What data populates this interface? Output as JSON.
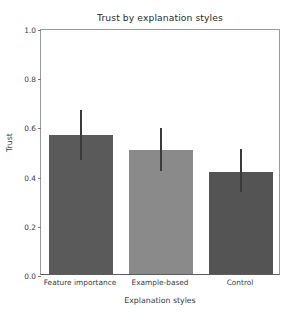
{
  "chart_data": {
    "type": "bar",
    "title": "Trust by explanation styles",
    "xlabel": "Explanation styles",
    "ylabel": "Trust",
    "categories": [
      "Feature importance",
      "Example-based",
      "Control"
    ],
    "values": [
      0.565,
      0.504,
      0.415
    ],
    "errors": [
      0.1,
      0.087,
      0.087
    ],
    "error_low": [
      0.463,
      0.419,
      0.333
    ],
    "error_high": [
      0.665,
      0.593,
      0.508
    ],
    "bar_colors": [
      "#5a5a5a",
      "#8a8a8a",
      "#545454"
    ],
    "errorbar_color": "#3a3a3a",
    "ylim": [
      0.0,
      1.0
    ],
    "yticks": [
      "0.0",
      "0.2",
      "0.4",
      "0.6",
      "0.8",
      "1.0"
    ],
    "ytick_values": [
      0.0,
      0.2,
      0.4,
      0.6,
      0.8,
      1.0
    ],
    "grid": false,
    "legend": "none"
  }
}
